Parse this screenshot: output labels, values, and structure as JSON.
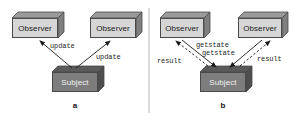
{
  "figure": {
    "background_color": "#ffffff",
    "divider_color": "#b9b9b9"
  },
  "colors": {
    "observer_fill": "#d6d6d6",
    "observer_top": "#9a9a9a",
    "observer_side": "#7f7f7f",
    "subject_fill": "#7d7d7d",
    "subject_top": "#5a5a5a",
    "subject_side": "#4e4e4e",
    "outline": "#4a4a4a",
    "arrow": "#1a1a1a",
    "text_dark": "#202020",
    "text_light": "#f2f2f2"
  },
  "panels": [
    {
      "id": "panel-a",
      "caption": "a",
      "nodes": [
        {
          "id": "observer-left",
          "label": "Observer",
          "type": "observer"
        },
        {
          "id": "observer-right",
          "label": "Observer",
          "type": "observer"
        },
        {
          "id": "subject",
          "label": "Subject",
          "type": "subject"
        }
      ],
      "edges": [
        {
          "id": "edge-update-left",
          "label": "update",
          "style": "solid",
          "from": "subject",
          "to": "observer-left"
        },
        {
          "id": "edge-update-right",
          "label": "update",
          "style": "solid",
          "from": "subject",
          "to": "observer-right"
        }
      ]
    },
    {
      "id": "panel-b",
      "caption": "b",
      "nodes": [
        {
          "id": "observer-left",
          "label": "Observer",
          "type": "observer"
        },
        {
          "id": "observer-right",
          "label": "Observer",
          "type": "observer"
        },
        {
          "id": "subject",
          "label": "Subject",
          "type": "subject"
        }
      ],
      "edges": [
        {
          "id": "edge-getstate-left",
          "label": "getstate",
          "style": "solid",
          "from": "observer-left",
          "to": "subject"
        },
        {
          "id": "edge-getstate-right",
          "label": "getstate",
          "style": "solid",
          "from": "observer-right",
          "to": "subject"
        },
        {
          "id": "edge-result-left",
          "label": "result",
          "style": "dashed",
          "from": "subject",
          "to": "observer-left"
        },
        {
          "id": "edge-result-right",
          "label": "result",
          "style": "dashed",
          "from": "subject",
          "to": "observer-right"
        }
      ]
    }
  ]
}
